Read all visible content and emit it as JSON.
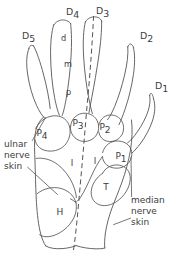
{
  "figure": {
    "type": "anatomical-line-diagram",
    "view": "palmar (volar) aspect, right hand",
    "background_color": "#ffffff",
    "line_color": "#555555",
    "label_color": "#3c3c3c",
    "midline": {
      "style": "dashed",
      "description": "vertical dashed axis through D3 and palm centre"
    }
  },
  "digits": [
    {
      "id": "D5",
      "base": "D",
      "sub": "5",
      "name": "little finger",
      "x": 22,
      "y": 36
    },
    {
      "id": "D4",
      "base": "D",
      "sub": "4",
      "name": "ring finger",
      "x": 66,
      "y": 12
    },
    {
      "id": "D3",
      "base": "D",
      "sub": "3",
      "name": "middle finger",
      "x": 96,
      "y": 11
    },
    {
      "id": "D2",
      "base": "D",
      "sub": "2",
      "name": "index finger",
      "x": 140,
      "y": 36
    },
    {
      "id": "D1",
      "base": "D",
      "sub": "1",
      "name": "thumb",
      "x": 155,
      "y": 86
    }
  ],
  "phalangeal_segments": [
    {
      "id": "d",
      "label": "d",
      "name": "distal phalanx",
      "x": 61,
      "y": 38
    },
    {
      "id": "m",
      "label": "m",
      "name": "middle phalanx",
      "x": 64,
      "y": 64
    },
    {
      "id": "p",
      "label": "p",
      "name": "proximal phalanx",
      "x": 66,
      "y": 92
    }
  ],
  "palmar_regions": [
    {
      "id": "P4",
      "base": "P",
      "sub": "4",
      "name": "fourth palmar pad",
      "x": 42,
      "y": 133
    },
    {
      "id": "P3",
      "base": "P",
      "sub": "3",
      "name": "third palmar pad",
      "x": 78,
      "y": 123
    },
    {
      "id": "P2",
      "base": "P",
      "sub": "2",
      "name": "second palmar pad",
      "x": 105,
      "y": 127
    },
    {
      "id": "P1",
      "base": "P",
      "sub": "1",
      "name": "first palmar pad",
      "x": 121,
      "y": 156
    }
  ],
  "other_regions": [
    {
      "id": "T",
      "label": "T",
      "name": "thenar eminence",
      "x": 106,
      "y": 187
    },
    {
      "id": "H",
      "label": "H",
      "name": "hypothenar eminence",
      "x": 60,
      "y": 212
    },
    {
      "id": "I-ulnar",
      "label": "I",
      "name": "interosseous area, ulnar side",
      "x": 72,
      "y": 163
    },
    {
      "id": "I-radial",
      "label": "I",
      "name": "interosseous area, radial side",
      "x": 95,
      "y": 161
    }
  ],
  "annotations": [
    {
      "id": "ulnar-nerve-skin",
      "lines": [
        "ulnar",
        "nerve",
        "skin"
      ],
      "x": 4,
      "y": 144,
      "align": "start",
      "leaders": 2
    },
    {
      "id": "median-nerve-skin",
      "lines": [
        "median",
        "nerve",
        "skin"
      ],
      "x": 131,
      "y": 200,
      "align": "start",
      "leaders": 2
    }
  ]
}
